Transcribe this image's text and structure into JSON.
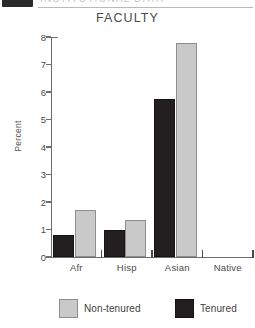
{
  "page_header": {
    "badge": "",
    "clipped_title": "INSTITUTIONAL DATA",
    "rule": "divider"
  },
  "chart_data": {
    "type": "bar",
    "title": "FACULTY",
    "xlabel": "",
    "ylabel": "Percent",
    "ylim": [
      0,
      8
    ],
    "yticks": [
      0,
      1,
      2,
      3,
      4,
      5,
      6,
      7,
      8
    ],
    "ytick_labels": [
      "0",
      "1",
      "2",
      "3",
      "4",
      "5",
      "6",
      "7",
      "8"
    ],
    "categories": [
      "Afr",
      "Hisp",
      "Asian",
      "Native"
    ],
    "grid": false,
    "legend_position": "bottom",
    "series": [
      {
        "name": "Tenured",
        "color": "#231f20",
        "values": [
          0.8,
          1.0,
          5.75,
          0
        ]
      },
      {
        "name": "Non-tenured",
        "color": "#c9c9c9",
        "values": [
          1.7,
          1.35,
          7.8,
          0
        ]
      }
    ]
  },
  "legend": {
    "items": [
      {
        "label": "Non-tenured",
        "color": "#c9c9c9"
      },
      {
        "label": "Tenured",
        "color": "#231f20"
      }
    ]
  }
}
